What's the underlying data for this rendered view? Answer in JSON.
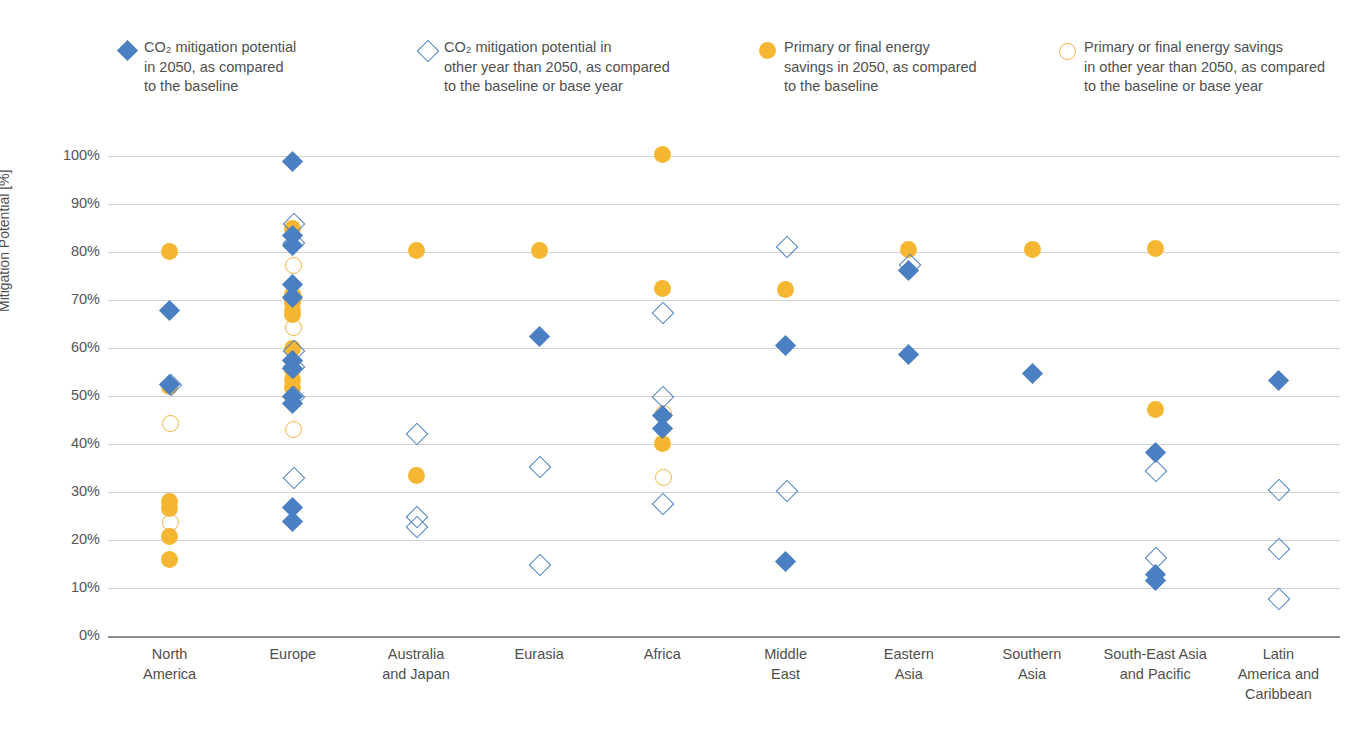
{
  "legend": {
    "items": [
      {
        "name": "co2-2050",
        "marker": "diamond-filled",
        "color": "#4a7fc1",
        "label": "CO₂ mitigation potential\nin 2050, as compared\nto the baseline"
      },
      {
        "name": "co2-other-year",
        "marker": "diamond-open",
        "color": "#4a7fc1",
        "label": "CO₂ mitigation potential in\nother year than 2050, as compared\nto the baseline or base year"
      },
      {
        "name": "energy-2050",
        "marker": "circle-filled",
        "color": "#f5b731",
        "label": "Primary or final energy\nsavings in 2050, as compared\nto the baseline"
      },
      {
        "name": "energy-other-year",
        "marker": "circle-open",
        "color": "#f0b23a",
        "label": "Primary or final energy savings\nin other year than 2050, as compared\nto the baseline or base year"
      }
    ]
  },
  "chart_data": {
    "type": "scatter",
    "title": "",
    "xlabel": "",
    "ylabel": "Mitigation Potential [%]",
    "ylim": [
      0,
      100
    ],
    "ytick_labels": [
      "0%",
      "10%",
      "20%",
      "30%",
      "40%",
      "50%",
      "60%",
      "70%",
      "80%",
      "90%",
      "100%"
    ],
    "ytick_values": [
      0,
      10,
      20,
      30,
      40,
      50,
      60,
      70,
      80,
      90,
      100
    ],
    "grid": true,
    "legend_position": "top",
    "categories": [
      "North\nAmerica",
      "Europe",
      "Australia\nand Japan",
      "Eurasia",
      "Africa",
      "Middle\nEast",
      "Eastern\nAsia",
      "Southern\nAsia",
      "South-East Asia\nand Pacific",
      "Latin\nAmerica and\nCaribbean"
    ],
    "series": [
      {
        "name": "CO₂ mitigation potential in 2050, as compared to the baseline",
        "marker": "diamond-filled",
        "color": "#4a7fc1",
        "points": [
          {
            "category": "North America",
            "value": 67.8
          },
          {
            "category": "North America",
            "value": 52.5
          },
          {
            "category": "Europe",
            "value": 98.9
          },
          {
            "category": "Europe",
            "value": 83.5
          },
          {
            "category": "Europe",
            "value": 81.3
          },
          {
            "category": "Europe",
            "value": 73.3
          },
          {
            "category": "Europe",
            "value": 70.5
          },
          {
            "category": "Europe",
            "value": 57.3
          },
          {
            "category": "Europe",
            "value": 55.8
          },
          {
            "category": "Europe",
            "value": 50.0
          },
          {
            "category": "Europe",
            "value": 48.4
          },
          {
            "category": "Europe",
            "value": 26.7
          },
          {
            "category": "Europe",
            "value": 23.9
          },
          {
            "category": "Eurasia",
            "value": 62.4
          },
          {
            "category": "Africa",
            "value": 46.0
          },
          {
            "category": "Africa",
            "value": 43.3
          },
          {
            "category": "Middle East",
            "value": 60.5
          },
          {
            "category": "Middle East",
            "value": 15.6
          },
          {
            "category": "Eastern Asia",
            "value": 76.1
          },
          {
            "category": "Eastern Asia",
            "value": 58.6
          },
          {
            "category": "Southern Asia",
            "value": 54.6
          },
          {
            "category": "South-East Asia and Pacific",
            "value": 38.2
          },
          {
            "category": "South-East Asia and Pacific",
            "value": 12.9
          },
          {
            "category": "South-East Asia and Pacific",
            "value": 11.5
          },
          {
            "category": "Latin America and Caribbean",
            "value": 53.2
          }
        ]
      },
      {
        "name": "CO₂ mitigation potential in other year than 2050, as compared to the baseline or base year",
        "marker": "diamond-open",
        "color": "#4a7fc1",
        "points": [
          {
            "category": "North America",
            "value": 52.6
          },
          {
            "category": "Europe",
            "value": 86.0
          },
          {
            "category": "Europe",
            "value": 82.0
          },
          {
            "category": "Europe",
            "value": 59.5
          },
          {
            "category": "Europe",
            "value": 56.2
          },
          {
            "category": "Europe",
            "value": 50.1
          },
          {
            "category": "Europe",
            "value": 33.1
          },
          {
            "category": "Australia and Japan",
            "value": 42.2
          },
          {
            "category": "Australia and Japan",
            "value": 25.1
          },
          {
            "category": "Australia and Japan",
            "value": 23.0
          },
          {
            "category": "Eurasia",
            "value": 35.5
          },
          {
            "category": "Eurasia",
            "value": 15.0
          },
          {
            "category": "Africa",
            "value": 67.4
          },
          {
            "category": "Africa",
            "value": 50.0
          },
          {
            "category": "Africa",
            "value": 27.8
          },
          {
            "category": "Middle East",
            "value": 81.3
          },
          {
            "category": "Middle East",
            "value": 30.5
          },
          {
            "category": "Eastern Asia",
            "value": 77.4
          },
          {
            "category": "South-East Asia and Pacific",
            "value": 34.5
          },
          {
            "category": "South-East Asia and Pacific",
            "value": 16.5
          },
          {
            "category": "Latin America and Caribbean",
            "value": 30.6
          },
          {
            "category": "Latin America and Caribbean",
            "value": 18.4
          },
          {
            "category": "Latin America and Caribbean",
            "value": 7.9
          }
        ]
      },
      {
        "name": "Primary or final energy savings in 2050, as compared to the baseline",
        "marker": "circle-filled",
        "color": "#f5b731",
        "points": [
          {
            "category": "North America",
            "value": 80.2
          },
          {
            "category": "North America",
            "value": 52.0
          },
          {
            "category": "North America",
            "value": 28.0
          },
          {
            "category": "North America",
            "value": 26.6
          },
          {
            "category": "North America",
            "value": 20.8
          },
          {
            "category": "North America",
            "value": 15.9
          },
          {
            "category": "Europe",
            "value": 84.9
          },
          {
            "category": "Europe",
            "value": 71.2
          },
          {
            "category": "Europe",
            "value": 69.5
          },
          {
            "category": "Europe",
            "value": 67.9
          },
          {
            "category": "Europe",
            "value": 66.9
          },
          {
            "category": "Europe",
            "value": 60.0
          },
          {
            "category": "Europe",
            "value": 55.6
          },
          {
            "category": "Europe",
            "value": 53.5
          },
          {
            "category": "Europe",
            "value": 51.7
          },
          {
            "category": "Australia and Japan",
            "value": 80.3
          },
          {
            "category": "Australia and Japan",
            "value": 33.5
          },
          {
            "category": "Eurasia",
            "value": 80.4
          },
          {
            "category": "Africa",
            "value": 100.4
          },
          {
            "category": "Africa",
            "value": 72.3
          },
          {
            "category": "Africa",
            "value": 40.1
          },
          {
            "category": "Middle East",
            "value": 72.2
          },
          {
            "category": "Eastern Asia",
            "value": 80.6
          },
          {
            "category": "Southern Asia",
            "value": 80.6
          },
          {
            "category": "South-East Asia and Pacific",
            "value": 80.7
          },
          {
            "category": "South-East Asia and Pacific",
            "value": 47.1
          }
        ]
      },
      {
        "name": "Primary or final energy savings in other year than 2050, as compared to the baseline or base year",
        "marker": "circle-open",
        "color": "#f0b23a",
        "points": [
          {
            "category": "North America",
            "value": 44.4
          },
          {
            "category": "North America",
            "value": 23.9
          },
          {
            "category": "Europe",
            "value": 77.3
          },
          {
            "category": "Europe",
            "value": 70.8
          },
          {
            "category": "Europe",
            "value": 64.5
          },
          {
            "category": "Europe",
            "value": 43.3
          },
          {
            "category": "Africa",
            "value": 46.6
          },
          {
            "category": "Africa",
            "value": 33.2
          }
        ]
      }
    ]
  }
}
